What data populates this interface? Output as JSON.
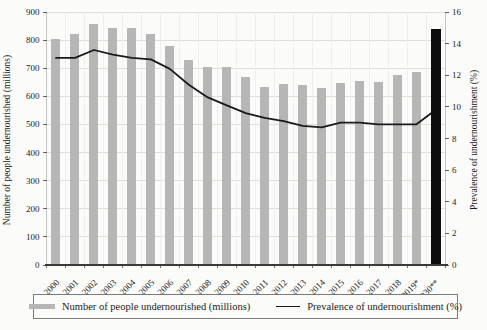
{
  "figure": {
    "background": "#fbfbf9",
    "text_color": "#1b1b1b"
  },
  "chart_data": {
    "type": "bar",
    "subtype": "combo-bar-line",
    "categories": [
      "2000",
      "2001",
      "2002",
      "2003",
      "2004",
      "2005",
      "2006",
      "2007",
      "2008",
      "2009",
      "2010",
      "2011",
      "2012",
      "2013",
      "2014",
      "2015",
      "2016",
      "2017",
      "2018",
      "2019*",
      "2030**"
    ],
    "series": [
      {
        "name": "Number of people undernourished (millions)",
        "type": "bar",
        "axis": "left",
        "color": "#b6b6b6",
        "highlight_last_index": 20,
        "highlight_color": "#0d0d0d",
        "values": [
          805,
          820,
          858,
          843,
          843,
          820,
          780,
          728,
          704,
          704,
          668,
          633,
          645,
          641,
          628,
          649,
          655,
          650,
          677,
          688,
          841
        ]
      },
      {
        "name": "Prevalence of undernourishment (%)",
        "type": "line",
        "axis": "right",
        "color": "#1a1a1a",
        "values": [
          13.1,
          13.1,
          13.6,
          13.3,
          13.1,
          13.0,
          12.4,
          11.4,
          10.6,
          10.1,
          9.6,
          9.3,
          9.1,
          8.8,
          8.7,
          9.0,
          9.0,
          8.9,
          8.9,
          8.9,
          9.8
        ]
      }
    ],
    "left_axis": {
      "label": "Number of people undernourished (millions)",
      "min": 0,
      "max": 900,
      "step": 100,
      "ticks": [
        "0",
        "100",
        "200",
        "300",
        "400",
        "500",
        "600",
        "700",
        "800",
        "900"
      ]
    },
    "right_axis": {
      "label": "Prevalence of undernourishment (%)",
      "min": 0,
      "max": 16,
      "step": 2,
      "ticks": [
        "0",
        "2",
        "4",
        "6",
        "8",
        "10",
        "12",
        "14",
        "16"
      ]
    },
    "grid": {
      "horizontal": true,
      "vertical": true
    },
    "legend_position": "bottom"
  },
  "legend": {
    "items": [
      {
        "label": "Number of people undernourished (millions)",
        "swatch": "gray-bar"
      },
      {
        "label": "Prevalence of undernourishment (%)",
        "swatch": "black-line"
      }
    ]
  }
}
